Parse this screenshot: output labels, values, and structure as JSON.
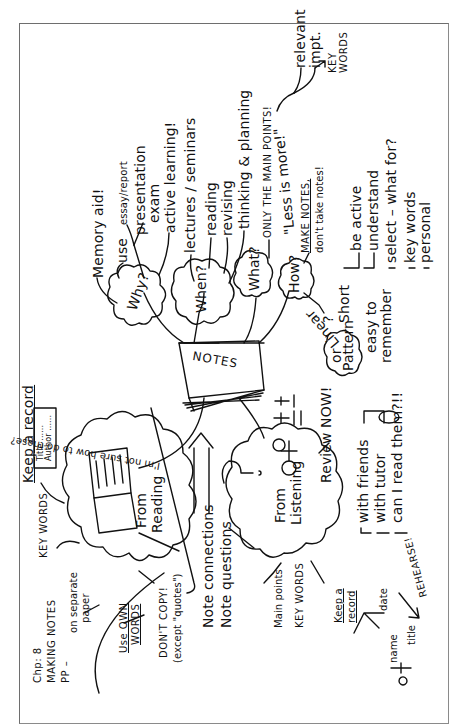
{
  "header": {
    "chapter": "Chp: 8",
    "title": "MAKING NOTES",
    "pp": "PP –"
  },
  "center": {
    "label": "NOTES"
  },
  "why": {
    "label": "Why?",
    "items": [
      "Memory aid!",
      "use",
      "essay/report",
      "presentation",
      "exam",
      "active learning!"
    ]
  },
  "when": {
    "label": "When?",
    "items": [
      "lectures / seminars",
      "reading",
      "revising",
      "thinking & planning"
    ]
  },
  "what": {
    "label": "What?",
    "main": "ONLY THE MAIN POINTS!",
    "quote": "\"Less is more!\"",
    "relevant": "relevant",
    "impt": "impt.",
    "key_words": "KEY WORDS"
  },
  "how": {
    "label": "How?",
    "make_notes": "MAKE NOTES,",
    "dont_take": "don't take notes!",
    "items": [
      "be active",
      "understand",
      "select – what for?",
      "key words",
      "personal"
    ],
    "short": "Short",
    "easy": "easy to",
    "remember": "remember",
    "linear": "Linear",
    "or": "or",
    "pattern": "Pattern",
    "q": "?"
  },
  "reading": {
    "label_1": "From",
    "label_2": "Reading",
    "keep_record": "Keep a record",
    "card_lines": [
      "Title ......",
      "Author ......",
      "Publisher ....."
    ],
    "not_sure": "I'm not sure how to do these?",
    "key_words": "KEY WORDS",
    "separate_1": "on separate",
    "separate_2": "paper",
    "own_words_1": "Use OWN",
    "own_words_2": "WORDS",
    "dont_copy": "DON'T COPY!",
    "except": "(except \"quotes\")"
  },
  "middle": {
    "connections": "Note connections",
    "questions": "Note questions"
  },
  "listening": {
    "label_1": "From",
    "label_2": "Listening",
    "main_points": "Main points",
    "key_words": "KEY WORDS",
    "keep_record_1": "Keep a",
    "keep_record_2": "record",
    "name": "name",
    "date": "date",
    "title": "title",
    "review": "Review NOW!",
    "items": [
      "with friends",
      "with tutor",
      "can I read them?!!"
    ],
    "rehearse": "REHEARSE!"
  }
}
